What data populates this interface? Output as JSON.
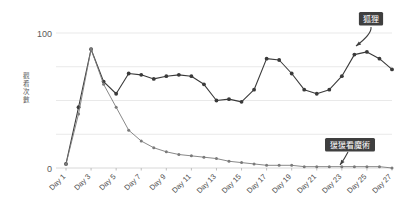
{
  "chart_data": {
    "type": "line",
    "title": "",
    "xlabel": "",
    "ylabel": "觀看次數",
    "ylim": [
      0,
      100
    ],
    "yticks": [
      0,
      100
    ],
    "ytick_labels": [
      "0",
      "100"
    ],
    "gridlines": [
      0,
      25,
      50,
      75,
      100
    ],
    "grid": true,
    "legend_position": "annotation-labels",
    "x": [
      1,
      2,
      3,
      4,
      5,
      6,
      7,
      8,
      9,
      10,
      11,
      12,
      13,
      14,
      15,
      16,
      17,
      18,
      19,
      20,
      21,
      22,
      23,
      24,
      25,
      26,
      27
    ],
    "xtick_labels": [
      "Day 1",
      "Day 3",
      "Day 5",
      "Day 7",
      "Day 9",
      "Day 11",
      "Day 13",
      "Day 15",
      "Day 17",
      "Day 19",
      "Day 21",
      "Day 23",
      "Day 25",
      "Day 27"
    ],
    "xtick_values": [
      1,
      3,
      5,
      7,
      9,
      11,
      13,
      15,
      17,
      19,
      21,
      23,
      25,
      27
    ],
    "series": [
      {
        "name": "狐狸",
        "color": "#3a3a3a",
        "values": [
          3,
          45,
          88,
          64,
          55,
          70,
          69,
          66,
          68,
          69,
          68,
          62,
          50,
          51,
          49,
          58,
          81,
          80,
          70,
          58,
          55,
          58,
          68,
          84,
          86,
          81,
          73
        ]
      },
      {
        "name": "猨猨看魔術",
        "color": "#7a7a7a",
        "values": [
          3,
          40,
          88,
          62,
          45,
          28,
          20,
          15,
          12,
          10,
          9,
          8,
          7,
          5,
          4,
          3,
          2,
          2,
          2,
          1,
          1,
          1,
          1,
          1,
          1,
          1,
          0
        ]
      }
    ],
    "annotations": [
      {
        "label": "狐狸",
        "target_x": 27,
        "target_y": 73
      },
      {
        "label": "猨猨看魔術",
        "target_x": 24,
        "target_y": 1
      }
    ]
  },
  "colors": {
    "series_primary": "#3a3a3a",
    "series_secondary": "#7a7a7a",
    "grid": "#e9e9e9",
    "badge_background": "#3f3f3f",
    "badge_text": "#ffffff",
    "background": "#ffffff"
  }
}
